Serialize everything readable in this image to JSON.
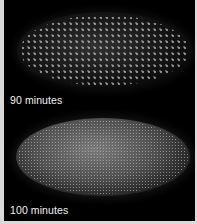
{
  "figure": {
    "panels": [
      {
        "label": "90 minutes",
        "description": "fluorescent embryo with sparse, distinct nuclei"
      },
      {
        "label": "100 minutes",
        "description": "fluorescent embryo with dense, fine nuclei"
      }
    ]
  },
  "colors": {
    "background": "#000000",
    "border": "#d9d9d9",
    "label_text": "#f2f2f2"
  }
}
